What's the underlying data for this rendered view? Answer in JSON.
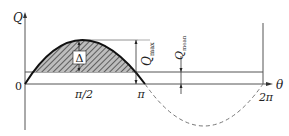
{
  "diagram": {
    "type": "half-wave rectified flow / charge curve",
    "axes": {
      "y_label": "Q",
      "x_label": "θ",
      "origin_label": "0",
      "x_ticks": [
        "π/2",
        "π",
        "2π"
      ]
    },
    "annotations": {
      "area_label": "Δ",
      "q_max_label": "Q",
      "q_max_sub": "max",
      "q_mean_label": "Q",
      "q_mean_sub": "mean"
    },
    "colors": {
      "line": "#222222",
      "hatch": "#333333",
      "axis": "#555555",
      "dashed": "#777777"
    }
  }
}
